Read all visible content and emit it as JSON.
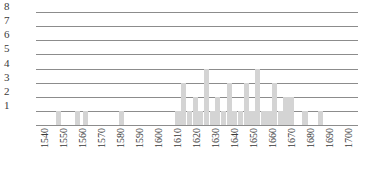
{
  "chart_data": {
    "type": "bar",
    "title": "",
    "subtitle": "",
    "xlabel": "",
    "ylabel": "",
    "grid": true,
    "legend": null,
    "xlim": [
      1535,
      1705
    ],
    "ylim": [
      0,
      8
    ],
    "bar_color": "#d4d4d4",
    "grid_color": "#8c8c8c",
    "y_ticks": [
      8,
      7,
      6,
      5,
      4,
      3,
      2,
      1
    ],
    "x_ticks": [
      1540,
      1550,
      1560,
      1570,
      1580,
      1590,
      1600,
      1610,
      1620,
      1630,
      1640,
      1650,
      1660,
      1670,
      1680,
      1690,
      1700
    ],
    "x": [
      1547,
      1557,
      1561,
      1580,
      1610,
      1613,
      1616,
      1619,
      1622,
      1625,
      1628,
      1631,
      1634,
      1637,
      1640,
      1643,
      1646,
      1649,
      1652,
      1655,
      1658,
      1661,
      1664,
      1667,
      1670,
      1677,
      1685
    ],
    "values": [
      1,
      1,
      1,
      1,
      1,
      3,
      1,
      2,
      1,
      4,
      1,
      2,
      1,
      3,
      1,
      1,
      3,
      1,
      4,
      1,
      1,
      3,
      1,
      2,
      2,
      1,
      1
    ],
    "categories": [
      "1547",
      "1557",
      "1561",
      "1580",
      "1610",
      "1613",
      "1616",
      "1619",
      "1622",
      "1625",
      "1628",
      "1631",
      "1634",
      "1637",
      "1640",
      "1643",
      "1646",
      "1649",
      "1652",
      "1655",
      "1658",
      "1661",
      "1664",
      "1667",
      "1670",
      "1677",
      "1685"
    ]
  }
}
